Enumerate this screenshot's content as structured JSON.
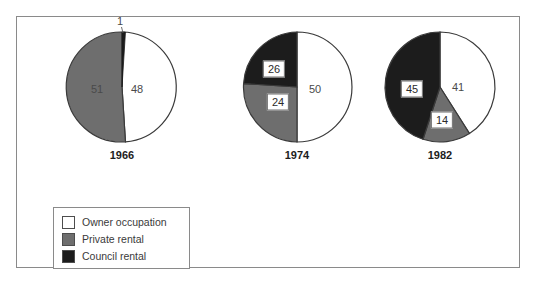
{
  "chart_data": {
    "type": "pie",
    "title": "",
    "xlabel": "",
    "ylabel": "",
    "legend_position": "bottom-left",
    "grid": false,
    "categories": [
      "Owner occupation",
      "Private rental",
      "Council rental"
    ],
    "colors": {
      "owner_occupation": "#ffffff",
      "private_rental": "#6e6e6e",
      "council_rental": "#1c1c1c",
      "outline": "#3a3a3a",
      "frame": "#8a8a8a"
    },
    "charts": [
      {
        "year": "1966",
        "slices": [
          {
            "category": "Owner occupation",
            "value": 48,
            "label": "48",
            "boxed": false
          },
          {
            "category": "Private rental",
            "value": 51,
            "label": "51",
            "boxed": true
          },
          {
            "category": "Council rental",
            "value": 1,
            "label": "1",
            "boxed": false
          }
        ]
      },
      {
        "year": "1974",
        "slices": [
          {
            "category": "Owner occupation",
            "value": 50,
            "label": "50",
            "boxed": false
          },
          {
            "category": "Private rental",
            "value": 24,
            "label": "24",
            "boxed": true
          },
          {
            "category": "Council rental",
            "value": 26,
            "label": "26",
            "boxed": true
          }
        ]
      },
      {
        "year": "1982",
        "slices": [
          {
            "category": "Owner occupation",
            "value": 41,
            "label": "41",
            "boxed": false
          },
          {
            "category": "Private rental",
            "value": 14,
            "label": "14",
            "boxed": true
          },
          {
            "category": "Council rental",
            "value": 45,
            "label": "45",
            "boxed": true
          }
        ]
      }
    ]
  },
  "pies": [
    {
      "year": "1966",
      "left": 30,
      "top": 10,
      "labels": [
        {
          "text": "51",
          "x": 50,
          "y": 62,
          "boxed": true
        },
        {
          "text": "48",
          "x": 90,
          "y": 62,
          "boxed": false
        },
        {
          "text": "1",
          "x": 73,
          "y": 7,
          "boxed": false
        }
      ]
    },
    {
      "year": "1974",
      "left": 205,
      "top": 10,
      "labels": [
        {
          "text": "26",
          "x": 52,
          "y": 42,
          "boxed": true
        },
        {
          "text": "24",
          "x": 56,
          "y": 75,
          "boxed": true
        },
        {
          "text": "50",
          "x": 93,
          "y": 62,
          "boxed": false
        }
      ]
    },
    {
      "year": "1982",
      "left": 348,
      "top": 10,
      "labels": [
        {
          "text": "45",
          "x": 47,
          "y": 62,
          "boxed": true
        },
        {
          "text": "41",
          "x": 93,
          "y": 60,
          "boxed": false
        },
        {
          "text": "14",
          "x": 77,
          "y": 93,
          "boxed": true
        }
      ]
    }
  ],
  "legend": {
    "items": [
      {
        "label": "Owner occupation",
        "color": "#ffffff"
      },
      {
        "label": "Private rental",
        "color": "#6e6e6e"
      },
      {
        "label": "Council rental",
        "color": "#1c1c1c"
      }
    ]
  }
}
